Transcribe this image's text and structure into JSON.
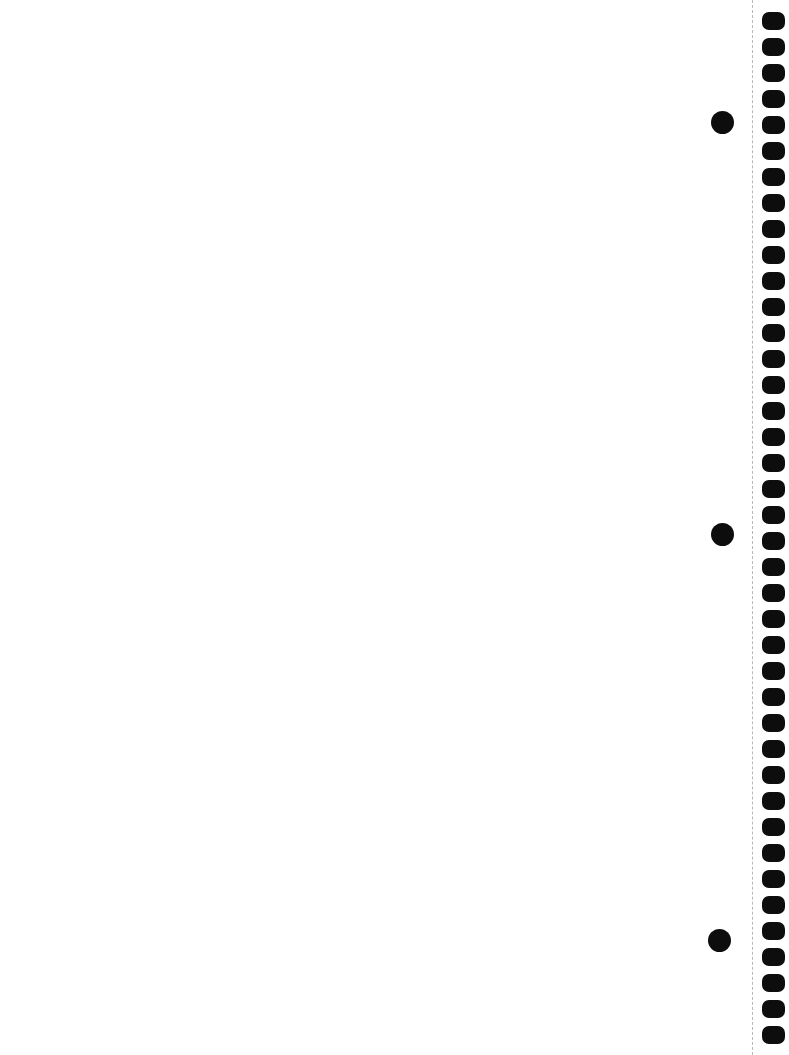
{
  "page": {
    "width": 789,
    "height": 1055,
    "background_color": "#ffffff",
    "content_text": "",
    "orientation": "portrait"
  },
  "writing_area": {
    "label": "Blank writing area",
    "left": 0,
    "top": 0,
    "width": 745,
    "height": 1055,
    "text": ""
  },
  "perforation": {
    "label": "Dashed perforation tear line",
    "x": 752,
    "color": "#b8b8b8",
    "dash_length": 4,
    "gap_length": 4,
    "thickness": 1
  },
  "binding": {
    "label": "Spiral binding hole strip",
    "strip_left": 758,
    "strip_width": 31,
    "hole_color": "#0d0d0d",
    "hole_left": 762,
    "hole_width": 23,
    "hole_height": 18,
    "hole_corner_radius": 7,
    "hole_spacing": 26,
    "first_hole_top": 12,
    "hole_count": 40,
    "holes": [
      {
        "top": 12
      },
      {
        "top": 38
      },
      {
        "top": 64
      },
      {
        "top": 90
      },
      {
        "top": 116
      },
      {
        "top": 142
      },
      {
        "top": 168
      },
      {
        "top": 194
      },
      {
        "top": 220
      },
      {
        "top": 246
      },
      {
        "top": 272
      },
      {
        "top": 298
      },
      {
        "top": 324
      },
      {
        "top": 350
      },
      {
        "top": 376
      },
      {
        "top": 402
      },
      {
        "top": 428
      },
      {
        "top": 454
      },
      {
        "top": 480
      },
      {
        "top": 506
      },
      {
        "top": 532
      },
      {
        "top": 558
      },
      {
        "top": 584
      },
      {
        "top": 610
      },
      {
        "top": 636
      },
      {
        "top": 662
      },
      {
        "top": 688
      },
      {
        "top": 714
      },
      {
        "top": 740
      },
      {
        "top": 766
      },
      {
        "top": 792
      },
      {
        "top": 818
      },
      {
        "top": 844
      },
      {
        "top": 870
      },
      {
        "top": 896
      },
      {
        "top": 922
      },
      {
        "top": 948
      },
      {
        "top": 974
      },
      {
        "top": 1000
      },
      {
        "top": 1026
      }
    ]
  },
  "margin_marks": {
    "label": "Filled circular margin registration marks",
    "color": "#0d0d0d",
    "marks": [
      {
        "name": "margin-mark-top",
        "center_x": 722,
        "center_y": 122,
        "diameter": 23
      },
      {
        "name": "margin-mark-middle",
        "center_x": 722,
        "center_y": 534,
        "diameter": 23
      },
      {
        "name": "margin-mark-bottom",
        "center_x": 719,
        "center_y": 940,
        "diameter": 23
      }
    ]
  }
}
